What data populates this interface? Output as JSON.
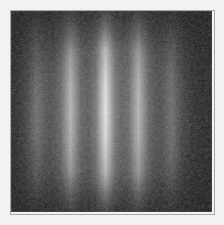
{
  "figure": {
    "medium": "grayscale photographic plate",
    "background_color": "#232323",
    "margin_color": "#f2f2f0",
    "plate_border_color": "#a8a8a4",
    "fringe_color": "#ffffff"
  },
  "chart_data": {
    "type": "heatmap",
    "subtitle": "",
    "xlabel": "",
    "ylabel": "",
    "grid": false,
    "legend": "none",
    "colormap": "grayscale",
    "xlim": [
      0,
      1
    ],
    "ylim": [
      0,
      1
    ],
    "intensity_range": [
      0,
      100
    ],
    "fringe_count": 5,
    "fringe_spacing_fraction": 0.168,
    "categories": [
      "m=-2",
      "m=-1",
      "m=0",
      "m=+1",
      "m=+2"
    ],
    "values": [
      42,
      76,
      100,
      80,
      48
    ],
    "series": [
      {
        "name": "fringe peak intensity (relative)",
        "values": [
          42,
          76,
          100,
          80,
          48
        ]
      },
      {
        "name": "fringe center x (fraction of plate width)",
        "values": [
          0.125,
          0.295,
          0.468,
          0.635,
          0.8
        ]
      },
      {
        "name": "fringe half-width (fraction of plate width)",
        "values": [
          0.062,
          0.058,
          0.055,
          0.058,
          0.062
        ]
      }
    ],
    "envelope": {
      "vertical_profile_name": "gaussian",
      "vertical_center_fraction": 0.52,
      "vertical_sigma_fraction": 0.26,
      "horizontal_profile_name": "single-slit diffraction",
      "horizontal_center_fraction": 0.47
    },
    "annotations": []
  },
  "plate": {
    "fringes": [
      {
        "id": "fringe-m-minus-2",
        "order": "m=-2",
        "center_pct": 12.5,
        "width_pct": 13.5,
        "peak_intensity": 42
      },
      {
        "id": "fringe-m-minus-1",
        "order": "m=-1",
        "center_pct": 29.5,
        "width_pct": 12.8,
        "peak_intensity": 76
      },
      {
        "id": "fringe-m-zero",
        "order": "m=0",
        "center_pct": 46.8,
        "width_pct": 12.2,
        "peak_intensity": 100
      },
      {
        "id": "fringe-m-plus-1",
        "order": "m=+1",
        "center_pct": 63.5,
        "width_pct": 12.8,
        "peak_intensity": 80
      },
      {
        "id": "fringe-m-plus-2",
        "order": "m=+2",
        "center_pct": 80.0,
        "width_pct": 13.5,
        "peak_intensity": 48
      }
    ]
  }
}
